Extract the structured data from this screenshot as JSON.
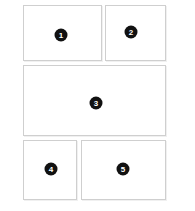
{
  "diagram": {
    "background_color": "#ffffff",
    "panel_fill_color": "#ffffff",
    "panel_border_color": "#cfcfcf",
    "badge_background_color": "#111111",
    "badge_text_color": "#ffffff",
    "canvas": {
      "width": 195,
      "height": 211
    },
    "panels": [
      {
        "id": "panel-1",
        "label": "1",
        "x": 23,
        "y": 5,
        "width": 79,
        "height": 56,
        "badge_x": 60,
        "badge_y": 34
      },
      {
        "id": "panel-2",
        "label": "2",
        "x": 105,
        "y": 5,
        "width": 61,
        "height": 56,
        "badge_x": 130,
        "badge_y": 31
      },
      {
        "id": "panel-3",
        "label": "3",
        "x": 23,
        "y": 65,
        "width": 143,
        "height": 71,
        "badge_x": 95,
        "badge_y": 102
      },
      {
        "id": "panel-4",
        "label": "4",
        "x": 23,
        "y": 140,
        "width": 54,
        "height": 60,
        "badge_x": 50,
        "badge_y": 168
      },
      {
        "id": "panel-5",
        "label": "5",
        "x": 81,
        "y": 140,
        "width": 85,
        "height": 60,
        "badge_x": 122,
        "badge_y": 168
      }
    ]
  }
}
